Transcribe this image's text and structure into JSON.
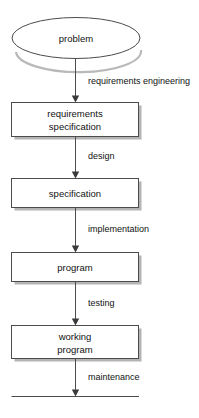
{
  "diagram": {
    "nodes": [
      {
        "id": "problem",
        "label_lines": [
          "problem"
        ],
        "shape": "ellipse"
      },
      {
        "id": "requirements",
        "label_lines": [
          "requirements",
          "specification"
        ],
        "shape": "rectangle"
      },
      {
        "id": "specification",
        "label_lines": [
          "specification"
        ],
        "shape": "rectangle"
      },
      {
        "id": "program",
        "label_lines": [
          "program"
        ],
        "shape": "rectangle"
      },
      {
        "id": "working",
        "label_lines": [
          "working",
          "program"
        ],
        "shape": "rectangle"
      }
    ],
    "edges": [
      {
        "id": "edge-1",
        "from": "problem",
        "to": "requirements",
        "label": "requirements engineering"
      },
      {
        "id": "edge-2",
        "from": "requirements",
        "to": "specification",
        "label": "design"
      },
      {
        "id": "edge-3",
        "from": "specification",
        "to": "program",
        "label": "implementation"
      },
      {
        "id": "edge-4",
        "from": "program",
        "to": "working",
        "label": "testing"
      },
      {
        "id": "edge-5",
        "from": "working",
        "to": "baseline",
        "label": "maintenance"
      }
    ],
    "colors": {
      "shape_stroke": "#4c4c4c",
      "shape_fill": "#ffffff",
      "shadow": "#b4b4b4",
      "text": "#111111",
      "background": "#ffffff"
    }
  }
}
